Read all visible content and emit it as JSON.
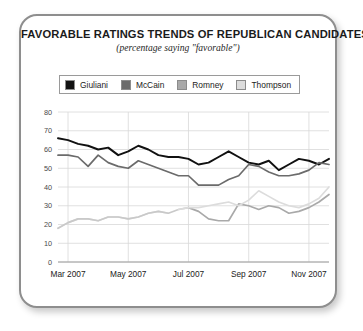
{
  "card": {
    "title": "FAVORABLE RATINGS TRENDS OF REPUBLICAN CANDIDATES",
    "subtitle": "(percentage saying \"favorable\")"
  },
  "legend": {
    "items": [
      {
        "label": "Giuliani",
        "color": "#111111"
      },
      {
        "label": "McCain",
        "color": "#6b6b6b"
      },
      {
        "label": "Romney",
        "color": "#a9a9a9"
      },
      {
        "label": "Thompson",
        "color": "#dcdcdc"
      }
    ]
  },
  "axes": {
    "y_ticks": [
      "0",
      "10",
      "20",
      "30",
      "40",
      "50",
      "60",
      "70",
      "80"
    ],
    "x_ticks": [
      "Mar 2007",
      "May 2007",
      "Jul 2007",
      "Sep 2007",
      "Nov 2007"
    ]
  },
  "chart_data": {
    "type": "line",
    "title": "FAVORABLE RATINGS TRENDS OF REPUBLICAN CANDIDATES",
    "subtitle": "(percentage saying \"favorable\")",
    "xlabel": "",
    "ylabel": "",
    "ylim": [
      0,
      80
    ],
    "ytick_step": 10,
    "grid": true,
    "legend_position": "top",
    "x_tick_labels": [
      "Mar 2007",
      "May 2007",
      "Jul 2007",
      "Sep 2007",
      "Nov 2007"
    ],
    "x_tick_positions": [
      1,
      7,
      13,
      19,
      25
    ],
    "x": [
      0,
      1,
      2,
      3,
      4,
      5,
      6,
      7,
      8,
      9,
      10,
      11,
      12,
      13,
      14,
      15,
      16,
      17,
      18,
      19,
      20,
      21,
      22,
      23,
      24,
      25,
      26,
      27
    ],
    "series": [
      {
        "name": "Giuliani",
        "color": "#111111",
        "values": [
          66,
          65,
          63,
          62,
          60,
          61,
          57,
          59,
          62,
          60,
          57,
          56,
          56,
          55,
          52,
          53,
          56,
          59,
          56,
          53,
          52,
          54,
          49,
          52,
          55,
          54,
          52,
          55
        ]
      },
      {
        "name": "McCain",
        "color": "#6b6b6b",
        "values": [
          57,
          57,
          56,
          51,
          57,
          53,
          51,
          50,
          54,
          52,
          50,
          48,
          46,
          46,
          41,
          41,
          41,
          44,
          46,
          52,
          51,
          48,
          46,
          46,
          47,
          49,
          53,
          52
        ]
      },
      {
        "name": "Romney",
        "color": "#a9a9a9",
        "values": [
          null,
          null,
          null,
          null,
          null,
          null,
          null,
          null,
          null,
          null,
          null,
          null,
          null,
          29,
          27,
          23,
          22,
          22,
          31,
          30,
          28,
          30,
          29,
          26,
          27,
          29,
          32,
          36
        ]
      },
      {
        "name": "Thompson",
        "color": "#dcdcdc",
        "values": [
          18,
          21,
          23,
          23,
          22,
          24,
          24,
          23,
          24,
          26,
          27,
          26,
          null,
          null,
          null,
          null,
          null,
          null,
          null,
          null,
          null,
          null,
          null,
          null,
          null,
          null,
          null,
          null
        ]
      }
    ],
    "series_notes": {
      "Romney_early": [
        18,
        21,
        23,
        23,
        22,
        24,
        24,
        23,
        24,
        26,
        27,
        26,
        28,
        29,
        27,
        23,
        22,
        22,
        31,
        30,
        28,
        30,
        29,
        26,
        27,
        29,
        32,
        36
      ],
      "Thompson_late": [
        null,
        null,
        null,
        null,
        null,
        null,
        null,
        null,
        null,
        null,
        null,
        null,
        28,
        29,
        29,
        30,
        31,
        32,
        30,
        33,
        38,
        35,
        32,
        30,
        29,
        31,
        34,
        40
      ]
    }
  }
}
